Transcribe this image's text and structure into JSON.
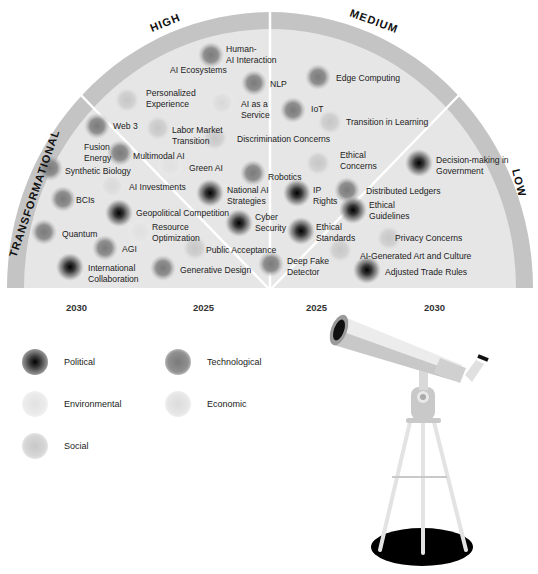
{
  "radar": {
    "segments": [
      {
        "label": "TRANSFORMATIONAL"
      },
      {
        "label": "HIGH"
      },
      {
        "label": "MEDIUM"
      },
      {
        "label": "LOW"
      }
    ],
    "timeline": [
      "2030",
      "2025",
      "2025",
      "2030"
    ],
    "colors": {
      "band": "#c4c4c4",
      "fill": "#e6e6e6",
      "divider": "#ffffff"
    },
    "items": [
      {
        "label": "Human-\nAI Interaction",
        "category": "Technological",
        "dot": [
          211,
          55
        ],
        "text": [
          226,
          44
        ]
      },
      {
        "label": "AI Ecosystems",
        "category": "Technological",
        "dot": [
          211,
          55
        ],
        "text": [
          170,
          65
        ]
      },
      {
        "label": "NLP",
        "category": "Technological",
        "dot": [
          254,
          83
        ],
        "text": [
          270,
          79
        ]
      },
      {
        "label": "Edge Computing",
        "category": "Technological",
        "dot": [
          318,
          77
        ],
        "text": [
          336,
          73
        ]
      },
      {
        "label": "Personalized\nExperience",
        "category": "Social",
        "dot": [
          127,
          100
        ],
        "text": [
          146,
          88
        ]
      },
      {
        "label": "AI as a\nService",
        "category": "Economic",
        "dot": [
          222,
          103
        ],
        "text": [
          241,
          99
        ]
      },
      {
        "label": "IoT",
        "category": "Technological",
        "dot": [
          293,
          110
        ],
        "text": [
          311,
          104
        ]
      },
      {
        "label": "Transition in Learning",
        "category": "Social",
        "dot": [
          330,
          122
        ],
        "text": [
          346,
          117
        ]
      },
      {
        "label": "Web 3",
        "category": "Technological",
        "dot": [
          97,
          126
        ],
        "text": [
          113,
          121
        ]
      },
      {
        "label": "Labor Market\nTransition",
        "category": "Social",
        "dot": [
          158,
          128
        ],
        "text": [
          172,
          125
        ]
      },
      {
        "label": "Discrimination Concerns",
        "category": "Social",
        "dot": [
          215,
          138
        ],
        "text": [
          237,
          134
        ]
      },
      {
        "label": "Fusion\nEnergy",
        "category": "Technological",
        "dot": [
          120,
          153
        ],
        "text": [
          84,
          142
        ]
      },
      {
        "label": "Multimodal AI",
        "category": "Technological",
        "dot": [
          120,
          153
        ],
        "text": [
          133,
          151
        ]
      },
      {
        "label": "Ethical\nConcerns",
        "category": "Social",
        "dot": [
          318,
          163
        ],
        "text": [
          340,
          150
        ]
      },
      {
        "label": "Synthetic Biology",
        "category": "Technological",
        "dot": [
          50,
          168
        ],
        "text": [
          65,
          166
        ]
      },
      {
        "label": "Green AI",
        "category": "Environmental",
        "dot": [
          170,
          165
        ],
        "text": [
          189,
          163
        ]
      },
      {
        "label": "Robotics",
        "category": "Technological",
        "dot": [
          253,
          173
        ],
        "text": [
          268,
          172
        ]
      },
      {
        "label": "Decision-making in\nGovernment",
        "category": "Political",
        "dot": [
          419,
          163
        ],
        "text": [
          436,
          155
        ]
      },
      {
        "label": "AI Investments",
        "category": "Economic",
        "dot": [
          112,
          186
        ],
        "text": [
          129,
          182
        ]
      },
      {
        "label": "National AI\nStrategies",
        "category": "Political",
        "dot": [
          210,
          193
        ],
        "text": [
          227,
          185
        ]
      },
      {
        "label": "IP\nRights",
        "category": "Political",
        "dot": [
          297,
          193
        ],
        "text": [
          313,
          185
        ]
      },
      {
        "label": "Distributed Ledgers",
        "category": "Technological",
        "dot": [
          347,
          190
        ],
        "text": [
          366,
          186
        ]
      },
      {
        "label": "BCIs",
        "category": "Technological",
        "dot": [
          63,
          199
        ],
        "text": [
          76,
          195
        ]
      },
      {
        "label": "Ethical\nGuidelines",
        "category": "Political",
        "dot": [
          353,
          210
        ],
        "text": [
          369,
          200
        ]
      },
      {
        "label": "Geopolitical Competition",
        "category": "Political",
        "dot": [
          119,
          213
        ],
        "text": [
          136,
          208
        ]
      },
      {
        "label": "Cyber\nSecurity",
        "category": "Political",
        "dot": [
          239,
          223
        ],
        "text": [
          255,
          212
        ]
      },
      {
        "label": "Resource\nOptimization",
        "category": "Environmental",
        "dot": [
          140,
          232
        ],
        "text": [
          152,
          222
        ]
      },
      {
        "label": "Ethical\nStandards",
        "category": "Political",
        "dot": [
          301,
          231
        ],
        "text": [
          316,
          222
        ]
      },
      {
        "label": "Quantum",
        "category": "Technological",
        "dot": [
          44,
          232
        ],
        "text": [
          62,
          229
        ]
      },
      {
        "label": "Privacy Concerns",
        "category": "Social",
        "dot": [
          389,
          238
        ],
        "text": [
          395,
          233
        ]
      },
      {
        "label": "Public Acceptance",
        "category": "Social",
        "dot": [
          195,
          248
        ],
        "text": [
          206,
          245
        ]
      },
      {
        "label": "AGI",
        "category": "Technological",
        "dot": [
          105,
          248
        ],
        "text": [
          122,
          244
        ]
      },
      {
        "label": "AI-Generated Art and Culture",
        "category": "Social",
        "dot": [
          340,
          250
        ],
        "text": [
          360,
          251
        ]
      },
      {
        "label": "Deep Fake\nDetector",
        "category": "Technological",
        "dot": [
          271,
          264
        ],
        "text": [
          287,
          256
        ]
      },
      {
        "label": "International\nCollaboration",
        "category": "Political",
        "dot": [
          70,
          267
        ],
        "text": [
          88,
          263
        ]
      },
      {
        "label": "Generative Design",
        "category": "Technological",
        "dot": [
          163,
          268
        ],
        "text": [
          180,
          265
        ]
      },
      {
        "label": "Adjusted Trade Rules",
        "category": "Political",
        "dot": [
          367,
          270
        ],
        "text": [
          385,
          267
        ]
      }
    ]
  },
  "legend": {
    "items": [
      {
        "label": "Political",
        "category": "Political"
      },
      {
        "label": "Technological",
        "category": "Technological"
      },
      {
        "label": "Environmental",
        "category": "Environmental"
      },
      {
        "label": "Economic",
        "category": "Economic"
      },
      {
        "label": "Social",
        "category": "Social"
      }
    ]
  },
  "category_styles": {
    "Political": {
      "center": "#000000",
      "mid": "#4a4a4a",
      "edge": "#8a8a8a"
    },
    "Technological": {
      "center": "#7a7a7a",
      "mid": "#8e8e8e",
      "edge": "#b5b5b5"
    },
    "Environmental": {
      "center": "#e2e2e2",
      "mid": "#e6e6e6",
      "edge": "#f0f0f0"
    },
    "Economic": {
      "center": "#dcdcdc",
      "mid": "#e3e3e3",
      "edge": "#eeeeee"
    },
    "Social": {
      "center": "#c8c8c8",
      "mid": "#d3d3d3",
      "edge": "#e8e8e8"
    }
  }
}
